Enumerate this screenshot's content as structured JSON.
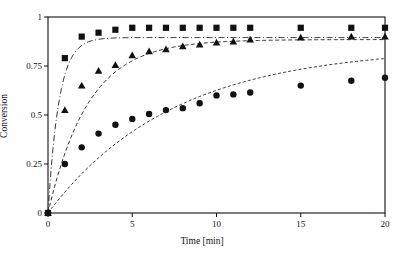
{
  "figure": {
    "caption_remnant": "",
    "background_color": "#ffffff",
    "ink_color": "#111111"
  },
  "axes": {
    "x_title": "Time [min]",
    "y_title": "Conversion",
    "x_ticks": [
      "0",
      "5",
      "10",
      "15",
      "20"
    ],
    "y_ticks": [
      "0",
      "0.25",
      "0.5",
      "0.75",
      "1"
    ]
  },
  "chart_data": {
    "type": "scatter",
    "title": "",
    "xlabel": "Time [min]",
    "ylabel": "Conversion",
    "xlim": [
      0,
      20
    ],
    "ylim": [
      0,
      1
    ],
    "xticks": [
      0,
      5,
      10,
      15,
      20
    ],
    "yticks": [
      0,
      0.25,
      0.5,
      0.75,
      1
    ],
    "grid": false,
    "legend": "none",
    "frame": "box",
    "series": [
      {
        "name": "Series 1",
        "marker": "square",
        "marker_color": "#111111",
        "fit_line_style": "dash-dot",
        "x": [
          0,
          1,
          2,
          3,
          4,
          5,
          6,
          7,
          8,
          9,
          10,
          11,
          12,
          15,
          18,
          20
        ],
        "y": [
          0.0,
          0.79,
          0.9,
          0.92,
          0.935,
          0.945,
          0.945,
          0.945,
          0.945,
          0.945,
          0.945,
          0.945,
          0.945,
          0.945,
          0.945,
          0.945
        ],
        "fit_plateau": 0.895,
        "fit_rate": 1.55
      },
      {
        "name": "Series 2",
        "marker": "triangle",
        "marker_color": "#111111",
        "fit_line_style": "dashed",
        "x": [
          0,
          1,
          2,
          3,
          4,
          5,
          6,
          7,
          8,
          9,
          10,
          11,
          12,
          15,
          18,
          20
        ],
        "y": [
          0.0,
          0.525,
          0.65,
          0.725,
          0.755,
          0.805,
          0.825,
          0.835,
          0.85,
          0.86,
          0.87,
          0.875,
          0.885,
          0.895,
          0.9,
          0.9
        ],
        "fit_plateau": 0.885,
        "fit_rate": 0.42
      },
      {
        "name": "Series 3",
        "marker": "circle",
        "marker_color": "#111111",
        "fit_line_style": "dashed-fine",
        "x": [
          0,
          1,
          2,
          3,
          4,
          5,
          6,
          7,
          8,
          9,
          10,
          11,
          12,
          15,
          18,
          20
        ],
        "y": [
          0.0,
          0.25,
          0.335,
          0.405,
          0.45,
          0.48,
          0.505,
          0.525,
          0.535,
          0.56,
          0.6,
          0.605,
          0.615,
          0.65,
          0.675,
          0.69
        ],
        "fit_plateau": 0.845,
        "fit_rate": 0.135
      }
    ]
  }
}
